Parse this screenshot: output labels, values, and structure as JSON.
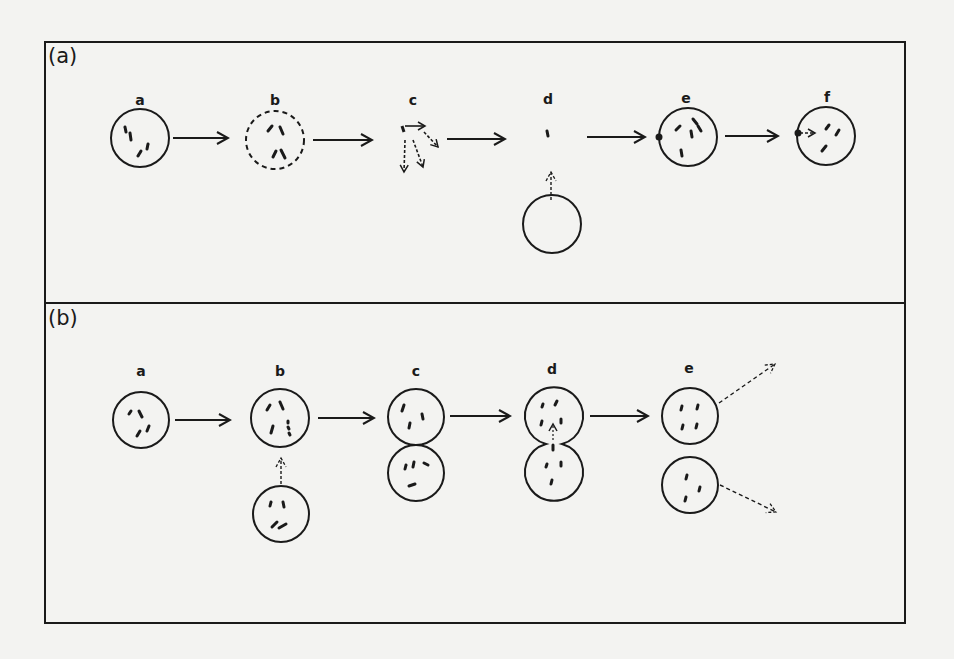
{
  "figure": {
    "colors": {
      "background": "#f3f3f1",
      "ink": "#1a1a1a"
    },
    "panels": [
      {
        "id": "a",
        "label": "(a)",
        "steps": [
          {
            "label": "a",
            "shape": "circle-solid",
            "contents": "4 rods"
          },
          {
            "label": "b",
            "shape": "circle-dashed",
            "contents": "4 rods"
          },
          {
            "label": "c",
            "shape": "none",
            "contents": "rods dispersing with dashed arrows"
          },
          {
            "label": "d",
            "shape": "single-rod",
            "contents": "1 rod, with empty circle below approaching via dashed arrow"
          },
          {
            "label": "e",
            "shape": "circle-solid",
            "contents": "rods inside, attached particle on left edge"
          },
          {
            "label": "f",
            "shape": "circle-solid",
            "contents": "rods inside, dashed arrow entering from left edge"
          }
        ],
        "arrows": [
          "a→b",
          "b→c",
          "c→d",
          "d→e",
          "e→f"
        ]
      },
      {
        "id": "b",
        "label": "(b)",
        "steps": [
          {
            "label": "a",
            "shape": "circle-solid",
            "contents": "4 rods"
          },
          {
            "label": "b",
            "shape": "circle-solid",
            "contents": "rods, with second circle below joining via dashed arrow"
          },
          {
            "label": "c",
            "shape": "two-circles-touching",
            "contents": "rods in each"
          },
          {
            "label": "d",
            "shape": "fused-peanut",
            "contents": "rods, dashed arrow between lobes"
          },
          {
            "label": "e",
            "shape": "two-separate-circles",
            "contents": "rods in each, dashed arrows leaving to the right"
          }
        ],
        "arrows": [
          "a→b",
          "b→c",
          "c→d",
          "d→e"
        ]
      }
    ]
  }
}
